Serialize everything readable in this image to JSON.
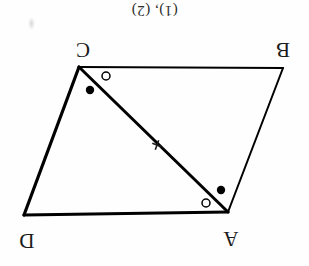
{
  "figure": {
    "caption": "(1), (2)",
    "orientation_degrees": 180,
    "background_color": "#fefefe",
    "stroke_color": "#000000",
    "shape_type": "parallelogram-with-diagonal",
    "vertices": [
      {
        "label": "C",
        "x": 79,
        "y": 67,
        "label_x": 72,
        "label_y": 36
      },
      {
        "label": "B",
        "x": 283,
        "y": 68,
        "label_x": 272,
        "label_y": 36
      },
      {
        "label": "A",
        "x": 228,
        "y": 212,
        "label_x": 220,
        "label_y": 225
      },
      {
        "label": "D",
        "x": 24,
        "y": 215,
        "label_x": 16,
        "label_y": 227
      }
    ],
    "sides": [
      {
        "name": "CB",
        "from": "C",
        "to": "B",
        "width": 2
      },
      {
        "name": "BA",
        "from": "B",
        "to": "A",
        "width": 2
      },
      {
        "name": "AD",
        "from": "A",
        "to": "D",
        "width": 3
      },
      {
        "name": "DC",
        "from": "D",
        "to": "C",
        "width": 3
      }
    ],
    "diagonal": {
      "name": "CA",
      "from": "C",
      "to": "A",
      "width": 3
    },
    "midpoint_tick": {
      "x": 157,
      "y": 145,
      "size": 9,
      "rotation": 20
    },
    "angle_marks": [
      {
        "name": "angle-mark-c-filled",
        "style": "filled",
        "x": 90,
        "y": 90,
        "r": 4.2
      },
      {
        "name": "angle-mark-c-hollow",
        "style": "hollow",
        "x": 106,
        "y": 76,
        "r": 4.2
      },
      {
        "name": "angle-mark-a-hollow",
        "style": "hollow",
        "x": 206,
        "y": 203,
        "r": 4.2
      },
      {
        "name": "angle-mark-a-filled",
        "style": "filled",
        "x": 221,
        "y": 190,
        "r": 4.2
      }
    ],
    "smudge": {
      "x": 28,
      "y": 17
    }
  }
}
